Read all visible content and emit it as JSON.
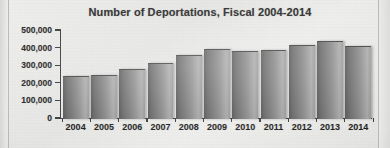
{
  "chart_data": {
    "type": "bar",
    "title": "Number of Deportations, Fiscal 2004-2014",
    "xlabel": "",
    "ylabel": "",
    "categories": [
      "2004",
      "2005",
      "2006",
      "2007",
      "2008",
      "2009",
      "2010",
      "2011",
      "2012",
      "2013",
      "2014"
    ],
    "values": [
      237000,
      246000,
      280000,
      315000,
      360000,
      390000,
      381000,
      385000,
      415000,
      435000,
      407000
    ],
    "ylim": [
      0,
      500000
    ],
    "ytick_labels": [
      "0",
      "100,000",
      "200,000",
      "300,000",
      "400,000",
      "500,000"
    ],
    "ytick_values": [
      0,
      100000,
      200000,
      300000,
      400000,
      500000
    ],
    "grid": false,
    "legend": false,
    "series": [
      {
        "name": "Deportations",
        "values": [
          237000,
          246000,
          280000,
          315000,
          360000,
          390000,
          381000,
          385000,
          415000,
          435000,
          407000
        ]
      }
    ],
    "colors": {
      "bar_dark": "#585858",
      "bar_light": "#adadad",
      "axis": "#3c3c3c",
      "text": "#262626",
      "background": "#e8e8e6"
    }
  }
}
